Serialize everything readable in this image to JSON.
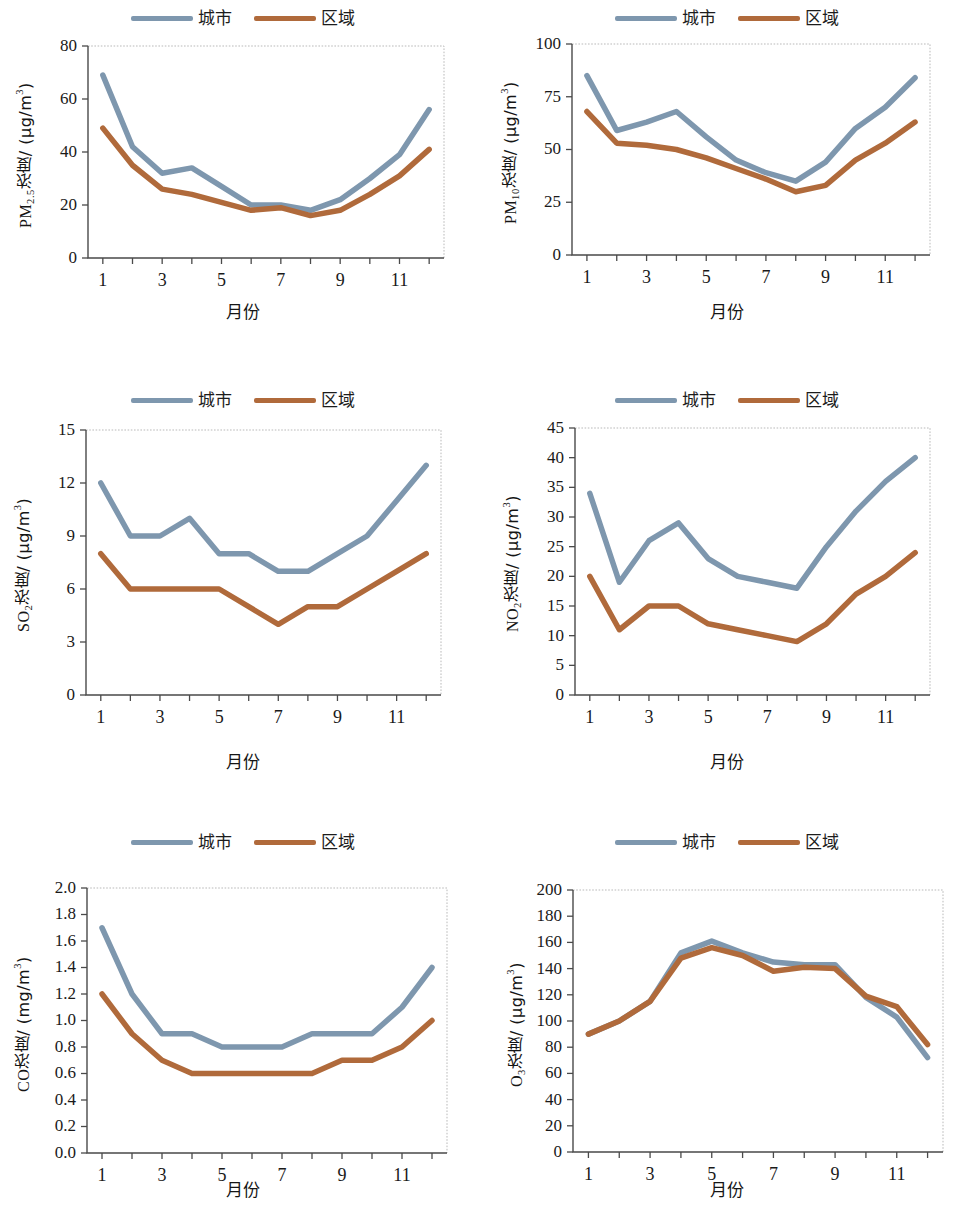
{
  "figure": {
    "panel_count": 6,
    "legend": {
      "entries": [
        {
          "label": "城市",
          "color": "#7E97AE",
          "name": "city"
        },
        {
          "label": "区域",
          "color": "#B06A3B",
          "name": "region"
        }
      ]
    },
    "common": {
      "xlabel": "月份",
      "x_categories": [
        1,
        2,
        3,
        4,
        5,
        6,
        7,
        8,
        9,
        10,
        11,
        12
      ],
      "x_tick_labels": [
        "1",
        "",
        "3",
        "",
        "5",
        "",
        "7",
        "",
        "9",
        "",
        "11",
        ""
      ]
    }
  },
  "chart_data": [
    {
      "id": "pm25",
      "type": "line",
      "title": "",
      "xlabel": "月份",
      "ylabel": "PM2.5浓度/ (μg/m3)",
      "ylabel_parts": {
        "pre": "PM",
        "sub": "2.5",
        "mid": "浓度/ (μg/m",
        "sup": "3",
        "post": ")"
      },
      "categories": [
        1,
        2,
        3,
        4,
        5,
        6,
        7,
        8,
        9,
        10,
        11,
        12
      ],
      "ylim": [
        0,
        80
      ],
      "yticks": [
        0,
        20,
        40,
        60,
        80
      ],
      "ytick_labels": [
        "0",
        "20",
        "40",
        "60",
        "80"
      ],
      "grid": false,
      "legend_position": "top-center",
      "series": [
        {
          "name": "城市",
          "color": "#7E97AE",
          "values": [
            69,
            42,
            32,
            34,
            27,
            20,
            20,
            18,
            22,
            30,
            39,
            56
          ]
        },
        {
          "name": "区域",
          "color": "#B06A3B",
          "values": [
            49,
            35,
            26,
            24,
            21,
            18,
            19,
            16,
            18,
            24,
            31,
            41
          ]
        }
      ]
    },
    {
      "id": "pm10",
      "type": "line",
      "title": "",
      "xlabel": "月份",
      "ylabel": "PM10浓度/ (μg/m3)",
      "ylabel_parts": {
        "pre": "PM",
        "sub": "10",
        "mid": "浓度/ (μg/m",
        "sup": "3",
        "post": ")"
      },
      "categories": [
        1,
        2,
        3,
        4,
        5,
        6,
        7,
        8,
        9,
        10,
        11,
        12
      ],
      "ylim": [
        0,
        100
      ],
      "yticks": [
        0,
        25,
        50,
        75,
        100
      ],
      "ytick_labels": [
        "0",
        "25",
        "50",
        "75",
        "100"
      ],
      "grid": false,
      "legend_position": "top-center",
      "series": [
        {
          "name": "城市",
          "color": "#7E97AE",
          "values": [
            85,
            59,
            63,
            68,
            56,
            45,
            39,
            35,
            44,
            60,
            70,
            84
          ]
        },
        {
          "name": "区域",
          "color": "#B06A3B",
          "values": [
            68,
            53,
            52,
            50,
            46,
            41,
            36,
            30,
            33,
            45,
            53,
            63
          ]
        }
      ]
    },
    {
      "id": "so2",
      "type": "line",
      "title": "",
      "xlabel": "月份",
      "ylabel": "SO2浓度/ (μg/m3)",
      "ylabel_parts": {
        "pre": "SO",
        "sub": "2",
        "mid": "浓度/ (μg/m",
        "sup": "3",
        "post": ")"
      },
      "categories": [
        1,
        2,
        3,
        4,
        5,
        6,
        7,
        8,
        9,
        10,
        11,
        12
      ],
      "ylim": [
        0,
        15
      ],
      "yticks": [
        0,
        3,
        6,
        9,
        12,
        15
      ],
      "ytick_labels": [
        "0",
        "3",
        "6",
        "9",
        "12",
        "15"
      ],
      "grid": false,
      "legend_position": "top-center",
      "series": [
        {
          "name": "城市",
          "color": "#7E97AE",
          "values": [
            12,
            9,
            9,
            10,
            8,
            8,
            7,
            7,
            8,
            9,
            11,
            13
          ]
        },
        {
          "name": "区域",
          "color": "#B06A3B",
          "values": [
            8,
            6,
            6,
            6,
            6,
            5,
            4,
            5,
            5,
            6,
            7,
            8
          ]
        }
      ]
    },
    {
      "id": "no2",
      "type": "line",
      "title": "",
      "xlabel": "月份",
      "ylabel": "NO2浓度/ (μg/m3)",
      "ylabel_parts": {
        "pre": "NO",
        "sub": "2",
        "mid": "浓度/ (μg/m",
        "sup": "3",
        "post": ")"
      },
      "categories": [
        1,
        2,
        3,
        4,
        5,
        6,
        7,
        8,
        9,
        10,
        11,
        12
      ],
      "ylim": [
        0,
        45
      ],
      "yticks": [
        0,
        5,
        10,
        15,
        20,
        25,
        30,
        35,
        40,
        45
      ],
      "ytick_labels": [
        "0",
        "5",
        "10",
        "15",
        "20",
        "25",
        "30",
        "35",
        "40",
        "45"
      ],
      "grid": false,
      "legend_position": "top-center",
      "series": [
        {
          "name": "城市",
          "color": "#7E97AE",
          "values": [
            34,
            19,
            26,
            29,
            23,
            20,
            19,
            18,
            25,
            31,
            36,
            40
          ]
        },
        {
          "name": "区域",
          "color": "#B06A3B",
          "values": [
            20,
            11,
            15,
            15,
            12,
            11,
            10,
            9,
            12,
            17,
            20,
            24
          ]
        }
      ]
    },
    {
      "id": "co",
      "type": "line",
      "title": "",
      "xlabel": "月份",
      "ylabel": "CO浓度/ (mg/m3)",
      "ylabel_parts": {
        "pre": "CO",
        "sub": "",
        "mid": "浓度/ (mg/m",
        "sup": "3",
        "post": ")"
      },
      "categories": [
        1,
        2,
        3,
        4,
        5,
        6,
        7,
        8,
        9,
        10,
        11,
        12
      ],
      "ylim": [
        0,
        2
      ],
      "yticks": [
        0,
        0.2,
        0.4,
        0.6,
        0.8,
        1.0,
        1.2,
        1.4,
        1.6,
        1.8,
        2.0
      ],
      "ytick_labels": [
        "0.0",
        "0.2",
        "0.4",
        "0.6",
        "0.8",
        "1.0",
        "1.2",
        "1.4",
        "1.6",
        "1.8",
        "2.0"
      ],
      "grid": false,
      "legend_position": "top-center",
      "series": [
        {
          "name": "城市",
          "color": "#7E97AE",
          "values": [
            1.7,
            1.2,
            0.9,
            0.9,
            0.8,
            0.8,
            0.8,
            0.9,
            0.9,
            0.9,
            1.1,
            1.4
          ]
        },
        {
          "name": "区域",
          "color": "#B06A3B",
          "values": [
            1.2,
            0.9,
            0.7,
            0.6,
            0.6,
            0.6,
            0.6,
            0.6,
            0.7,
            0.7,
            0.8,
            1.0
          ]
        }
      ]
    },
    {
      "id": "o3",
      "type": "line",
      "title": "",
      "xlabel": "月份",
      "ylabel": "O3浓度/ (μg/m3)",
      "ylabel_parts": {
        "pre": "O",
        "sub": "3",
        "mid": "浓度/ (μg/m",
        "sup": "3",
        "post": ")"
      },
      "categories": [
        1,
        2,
        3,
        4,
        5,
        6,
        7,
        8,
        9,
        10,
        11,
        12
      ],
      "ylim": [
        0,
        200
      ],
      "yticks": [
        0,
        20,
        40,
        60,
        80,
        100,
        120,
        140,
        160,
        180,
        200
      ],
      "ytick_labels": [
        "0",
        "20",
        "40",
        "60",
        "80",
        "100",
        "120",
        "140",
        "160",
        "180",
        "200"
      ],
      "grid": false,
      "legend_position": "top-center",
      "series": [
        {
          "name": "城市",
          "color": "#7E97AE",
          "values": [
            90,
            100,
            115,
            152,
            161,
            152,
            145,
            143,
            143,
            118,
            103,
            72
          ]
        },
        {
          "name": "区域",
          "color": "#B06A3B",
          "values": [
            90,
            100,
            115,
            148,
            156,
            150,
            138,
            141,
            140,
            119,
            111,
            82
          ]
        }
      ]
    }
  ]
}
